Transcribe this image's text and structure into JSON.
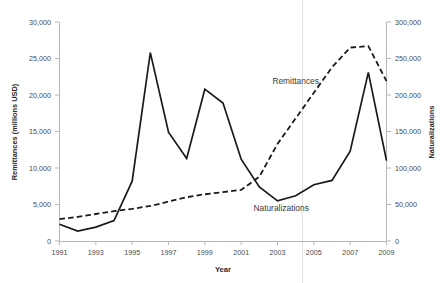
{
  "chart_data": {
    "type": "line",
    "title": "",
    "xlabel": "Year",
    "ylabel": "Remittances (millions USD)",
    "y2label": "Naturalizations",
    "grid": false,
    "legend_position": "inline-annotation",
    "x": [
      1991,
      1992,
      1993,
      1994,
      1995,
      1996,
      1997,
      1998,
      1999,
      2000,
      2001,
      2002,
      2003,
      2004,
      2005,
      2006,
      2007,
      2008,
      2009
    ],
    "xlim": [
      1991,
      2009
    ],
    "xticks": [
      1991,
      1993,
      1995,
      1997,
      1999,
      2001,
      2003,
      2005,
      2007,
      2009
    ],
    "xticklabels": [
      "1991",
      "1993",
      "1995",
      "1997",
      "1999",
      "2001",
      "2003",
      "2005",
      "2007",
      "2009"
    ],
    "ylim": [
      0,
      30000
    ],
    "yticks": [
      0,
      5000,
      10000,
      15000,
      20000,
      25000,
      30000
    ],
    "yticklabels": [
      "0",
      "5,000",
      "10,000",
      "15,000",
      "20,000",
      "25,000",
      "30,000"
    ],
    "y2lim": [
      0,
      300000
    ],
    "y2ticks": [
      0,
      50000,
      100000,
      150000,
      200000,
      250000,
      300000
    ],
    "y2ticklabels": [
      "0",
      "50,000",
      "100,000",
      "150,000",
      "200,000",
      "250,000",
      "300,000"
    ],
    "series": [
      {
        "name": "Remittances",
        "axis": "left",
        "style": "dashed",
        "label_text": "Remittances",
        "units": "millions USD",
        "values": [
          3000,
          3300,
          3700,
          4100,
          4400,
          4800,
          5400,
          6000,
          6400,
          6700,
          7000,
          8800,
          13300,
          16800,
          20300,
          23800,
          26500,
          26700,
          21900
        ]
      },
      {
        "name": "Naturalizations",
        "axis": "right",
        "style": "solid",
        "label_text": "Naturalizations",
        "units": "persons",
        "values": [
          23000,
          13500,
          19000,
          28000,
          82000,
          258000,
          149000,
          113000,
          208000,
          189000,
          112000,
          74000,
          55000,
          62000,
          77000,
          83000,
          123000,
          231000,
          110000
        ]
      }
    ],
    "annotations": [
      {
        "text": "Remittances",
        "x": 2004.0,
        "y_axis": "left",
        "y": 21500
      },
      {
        "text": "Naturalizations",
        "x": 2003.2,
        "y_axis": "left",
        "y": 4100
      }
    ]
  }
}
